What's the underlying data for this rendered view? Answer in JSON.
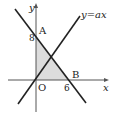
{
  "diagram": {
    "type": "coordinate-geometry",
    "axes": {
      "x_label": "x",
      "y_label": "y",
      "origin_label": "O"
    },
    "points": {
      "A": {
        "label": "A",
        "coords": [
          0,
          8
        ]
      },
      "B": {
        "label": "B",
        "coords": [
          6,
          0
        ]
      },
      "O": {
        "label": "O",
        "coords": [
          0,
          0
        ]
      }
    },
    "tick_labels": {
      "y_tick": "8",
      "x_tick": "6"
    },
    "lines": [
      {
        "name": "line-AB",
        "label": ""
      },
      {
        "name": "line-y-ax",
        "label": "y=ax"
      }
    ],
    "shaded_region": "triangle OAB",
    "colors": {
      "line": "#222222",
      "shade": "#dcdcdc",
      "axis": "#555555"
    }
  }
}
